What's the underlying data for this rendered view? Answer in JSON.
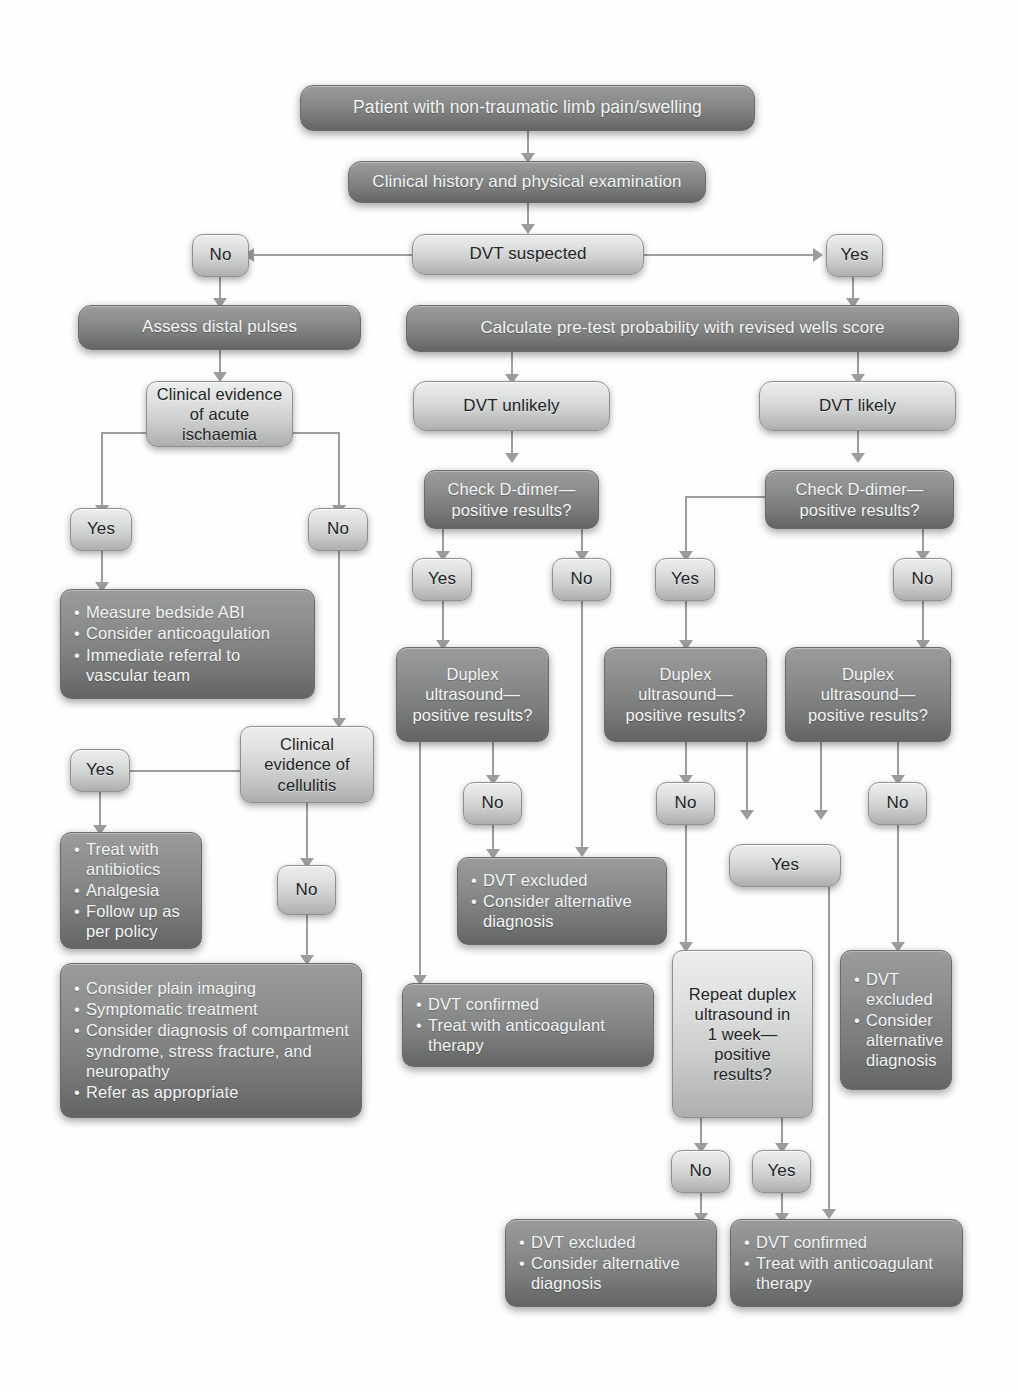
{
  "diagram": {
    "theme": {
      "light_box_fill": "#e0e1e1",
      "dark_box_fill": "#8d8e8e",
      "light_box_text": "#222426",
      "dark_box_text": "#f4f5f5",
      "connector": "#9b9d9e",
      "background": "#fefefe"
    }
  },
  "nodes": {
    "start": "Patient with non-traumatic limb pain/swelling",
    "history": "Clinical history and physical examination",
    "dvt_suspected": "DVT suspected",
    "suspected_no": "No",
    "suspected_yes": "Yes",
    "assess_pulses": "Assess distal pulses",
    "wells": "Calculate pre-test probability with revised wells score",
    "ischaemia": "Clinical evidence\nof acute ischaemia",
    "ischaemia_yes": "Yes",
    "ischaemia_no": "No",
    "dvt_unlikely": "DVT unlikely",
    "dvt_likely": "DVT likely",
    "ddimer_unlikely": "Check D-dimer—\npositive results?",
    "ddimer_likely": "Check D-dimer—\npositive results?",
    "ischaemia_action": {
      "items": [
        "Measure bedside ABI",
        "Consider anticoagulation",
        "Immediate referral to vascular team"
      ]
    },
    "ddimer_unlikely_yes": "Yes",
    "ddimer_unlikely_no": "No",
    "ddimer_likely_yes": "Yes",
    "ddimer_likely_no": "No",
    "duplex_a": "Duplex\nultrasound—\npositive results?",
    "duplex_b": "Duplex\nultrasound—\npositive results?",
    "duplex_c": "Duplex\nultrasound—\npositive results?",
    "cellulitis": "Clinical\nevidence of\ncellulitis",
    "cellulitis_yes": "Yes",
    "cellulitis_no": "No",
    "duplex_a_no": "No",
    "duplex_b_no": "No",
    "duplex_c_no": "No",
    "duplex_yes_merge": "Yes",
    "cellulitis_action": {
      "items": [
        "Treat with antibiotics",
        "Analgesia",
        "Follow up as per policy"
      ]
    },
    "no_cellulitis_action": {
      "items": [
        "Consider plain imaging",
        "Symptomatic treatment",
        "Consider diagnosis of compartment syndrome, stress fracture, and neuropathy",
        "Refer as appropriate"
      ]
    },
    "excluded_mid": {
      "items": [
        "DVT excluded",
        "Consider alternative diagnosis"
      ]
    },
    "confirmed_mid": {
      "items": [
        "DVT confirmed",
        "Treat with  anticoagulant therapy"
      ]
    },
    "repeat_duplex": "Repeat duplex\nultrasound in\n1 week—\npositive\nresults?",
    "excluded_right": {
      "items": [
        "DVT excluded",
        "Consider alternative diagnosis"
      ]
    },
    "repeat_no": "No",
    "repeat_yes": "Yes",
    "excluded_bottom": {
      "items": [
        "DVT excluded",
        "Consider alternative diagnosis"
      ]
    },
    "confirmed_bottom": {
      "items": [
        "DVT confirmed",
        "Treat with anticoagulant therapy"
      ]
    }
  }
}
